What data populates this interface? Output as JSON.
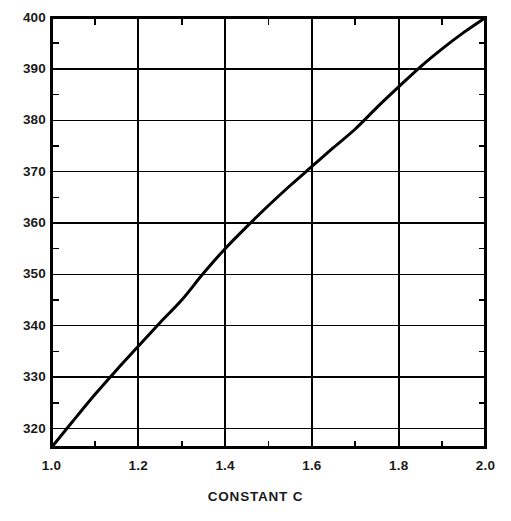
{
  "chart_data": {
    "type": "line",
    "title": "",
    "subtitle": "",
    "xlabel": "CONSTANT C",
    "ylabel": "",
    "xlim": [
      1.0,
      2.0
    ],
    "ylim": [
      316.3,
      400
    ],
    "grid": true,
    "legend": null,
    "legend_position": "none",
    "x_major_ticks": [
      1.0,
      1.2,
      1.4,
      1.6,
      1.8,
      2.0
    ],
    "x_minor_ticks": [
      1.1,
      1.3,
      1.5,
      1.7,
      1.9
    ],
    "x_tick_labels": [
      "1.0",
      "1.2",
      "1.4",
      "1.6",
      "1.8",
      "2.0"
    ],
    "y_major_ticks": [
      320,
      330,
      340,
      350,
      360,
      370,
      380,
      390,
      400
    ],
    "y_minor_ticks": [
      325,
      335,
      345,
      355,
      365,
      375,
      385,
      395
    ],
    "y_tick_labels": [
      "320",
      "330",
      "340",
      "350",
      "360",
      "370",
      "380",
      "390",
      "400"
    ],
    "x_gridlines": [
      1.2,
      1.4,
      1.6,
      1.8
    ],
    "y_gridlines": [
      320,
      330,
      340,
      350,
      360,
      370,
      380,
      390
    ],
    "series": [
      {
        "name": "curve",
        "color": "#000000",
        "line_width": 3,
        "x": [
          1.0,
          1.05,
          1.1,
          1.15,
          1.2,
          1.25,
          1.3,
          1.35,
          1.4,
          1.45,
          1.5,
          1.55,
          1.6,
          1.65,
          1.7,
          1.75,
          1.8,
          1.85,
          1.9,
          1.95,
          2.0
        ],
        "y": [
          316.3,
          321.5,
          326.6,
          331.4,
          336.0,
          340.6,
          345.0,
          350.2,
          355.0,
          359.3,
          363.4,
          367.3,
          371.0,
          374.7,
          378.3,
          382.5,
          386.5,
          390.4,
          393.9,
          397.1,
          400.0
        ]
      }
    ],
    "key_points": [
      {
        "x": 1.0,
        "y": 316.3
      },
      {
        "x": 1.2,
        "y": 336.0
      },
      {
        "x": 1.4,
        "y": 355.0
      },
      {
        "x": 1.6,
        "y": 371.0
      },
      {
        "x": 1.8,
        "y": 386.5
      },
      {
        "x": 2.0,
        "y": 400.0
      }
    ]
  },
  "axis_colors": {
    "frame": "#000000",
    "gridline": "#000000",
    "curve": "#000000",
    "text": "#1a1a1a",
    "background": "#ffffff"
  },
  "xaxis": {
    "title": "CONSTANT C"
  }
}
